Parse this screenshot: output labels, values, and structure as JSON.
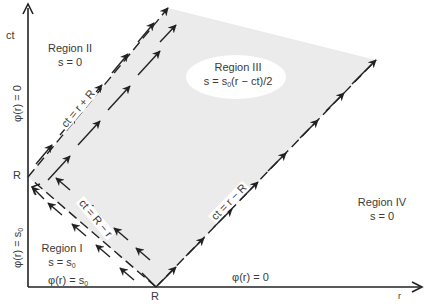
{
  "axes": {
    "vertical_label": "ct",
    "horizontal_label": "r",
    "vertical_tick": "R",
    "horizontal_tick": "R"
  },
  "boundary_conditions": {
    "left_upper": "φ(r) = 0",
    "left_lower": "φ(r) = s",
    "left_lower_sub": "0",
    "bottom_left": "φ(r) = s",
    "bottom_left_sub": "0",
    "bottom_right": "φ(r) = 0"
  },
  "regions": [
    {
      "name": "Region I",
      "eq": "s = s",
      "eq_sub": "0"
    },
    {
      "name": "Region II",
      "eq": "s = 0"
    },
    {
      "name": "Region III",
      "eq_pre": "s = s",
      "eq_sub": "0",
      "eq_post": "(r − ct)/2"
    },
    {
      "name": "Region IV",
      "eq": "s = 0"
    }
  ],
  "characteristics": [
    {
      "label": "ct = r + R"
    },
    {
      "label": "ct = R − r"
    },
    {
      "label": "ct = r − R"
    }
  ],
  "colors": {
    "shade": "#ebebeb",
    "line": "#222222",
    "text": "#3a3a3a"
  }
}
